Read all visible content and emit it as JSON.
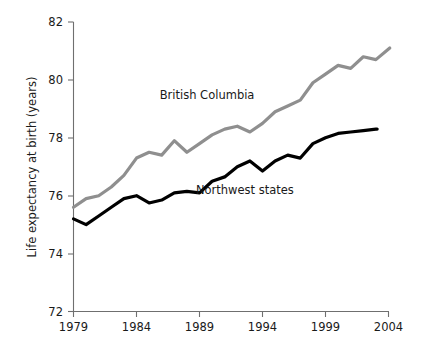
{
  "chart_data": {
    "type": "line",
    "title": "",
    "subtitle": "",
    "xlabel": "",
    "ylabel": "Life expectancy at birth (years)",
    "xlim": [
      1979,
      2004.5
    ],
    "ylim": [
      72,
      82
    ],
    "xticks": [
      1979,
      1984,
      1989,
      1994,
      1999,
      2004
    ],
    "xtick_labels": [
      "1979",
      "1984",
      "1989",
      "1994",
      "1999",
      "2004"
    ],
    "yticks": [
      72,
      74,
      76,
      78,
      80,
      82
    ],
    "ytick_labels": [
      "72",
      "74",
      "76",
      "78",
      "80",
      "82"
    ],
    "grid": false,
    "legend_position": "inline-annotation",
    "x": [
      1979,
      1980,
      1981,
      1982,
      1983,
      1984,
      1985,
      1986,
      1987,
      1988,
      1989,
      1990,
      1991,
      1992,
      1993,
      1994,
      1995,
      1996,
      1997,
      1998,
      1999,
      2000,
      2001,
      2002,
      2003
    ],
    "series": [
      {
        "name": "British Columbia",
        "color": "#8f8f8f",
        "values": [
          75.6,
          75.9,
          76.0,
          76.3,
          76.7,
          77.3,
          77.5,
          77.4,
          77.9,
          77.5,
          77.8,
          78.1,
          78.3,
          78.4,
          78.2,
          78.5,
          78.9,
          79.1,
          79.3,
          79.9,
          80.2,
          80.5,
          80.4,
          80.8,
          80.7
        ],
        "label_position": {
          "x": 1989.6,
          "y": 79.35
        }
      },
      {
        "name": "Northwest states",
        "color": "#000000",
        "values": [
          75.2,
          75.0,
          75.3,
          75.6,
          75.9,
          76.0,
          75.75,
          75.85,
          76.1,
          76.15,
          76.1,
          76.5,
          76.65,
          77.0,
          77.2,
          76.85,
          77.2,
          77.4,
          77.3,
          77.8,
          78.0,
          78.15,
          78.2,
          78.25,
          78.3
        ],
        "label_position": {
          "x": 1992.6,
          "y": 76.05
        }
      }
    ],
    "series_end_points": [
      {
        "name": "British Columbia",
        "x": 2004.1,
        "y": 81.1
      },
      {
        "name": "Northwest states",
        "x": 2003.1,
        "y": 78.3
      }
    ],
    "annotations": [
      {
        "text": "British Columbia",
        "name": "british-columbia-label"
      },
      {
        "text": "Northwest states",
        "name": "northwest-states-label"
      }
    ]
  }
}
